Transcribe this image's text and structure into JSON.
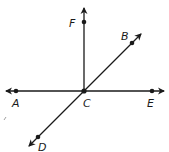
{
  "diagram": {
    "type": "geometry-lines-and-rays",
    "colors": {
      "stroke": "#1a1a1a",
      "background": "#ffffff"
    },
    "points": {
      "A": {
        "label": "A",
        "x": 16,
        "y": 91
      },
      "B": {
        "label": "B",
        "x": 132,
        "y": 43
      },
      "C": {
        "label": "C",
        "x": 84,
        "y": 91
      },
      "D": {
        "label": "D",
        "x": 38,
        "y": 137
      },
      "E": {
        "label": "E",
        "x": 152,
        "y": 91
      },
      "F": {
        "label": "F",
        "x": 84,
        "y": 22
      }
    },
    "elements": [
      {
        "kind": "line",
        "name": "line-AE",
        "through": [
          "A",
          "C",
          "E"
        ]
      },
      {
        "kind": "line",
        "name": "line-BD",
        "through": [
          "B",
          "C",
          "D"
        ]
      },
      {
        "kind": "ray",
        "name": "ray-CF",
        "from": "C",
        "through": "F"
      }
    ]
  }
}
